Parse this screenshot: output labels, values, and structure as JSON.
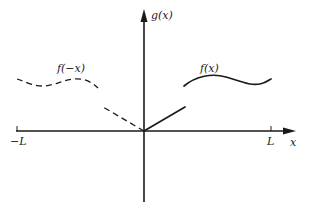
{
  "diagram": {
    "axes": {
      "y_label": "g(x)",
      "x_label": "x",
      "ticks": [
        {
          "label": "−L",
          "position": "left"
        },
        {
          "label": "L",
          "position": "right"
        }
      ]
    },
    "curves": [
      {
        "label": "f(−x)",
        "style": "dashed",
        "side": "left"
      },
      {
        "label": "f(x)",
        "style": "solid",
        "side": "right"
      }
    ],
    "segments": [
      {
        "name": "right-linear-segment",
        "style": "solid",
        "from": "origin",
        "direction": "up-right"
      },
      {
        "name": "left-linear-segment",
        "style": "dashed",
        "from": "origin",
        "direction": "up-left"
      }
    ],
    "colors": {
      "ink": "#1a1a1a",
      "background": "#ffffff"
    }
  }
}
